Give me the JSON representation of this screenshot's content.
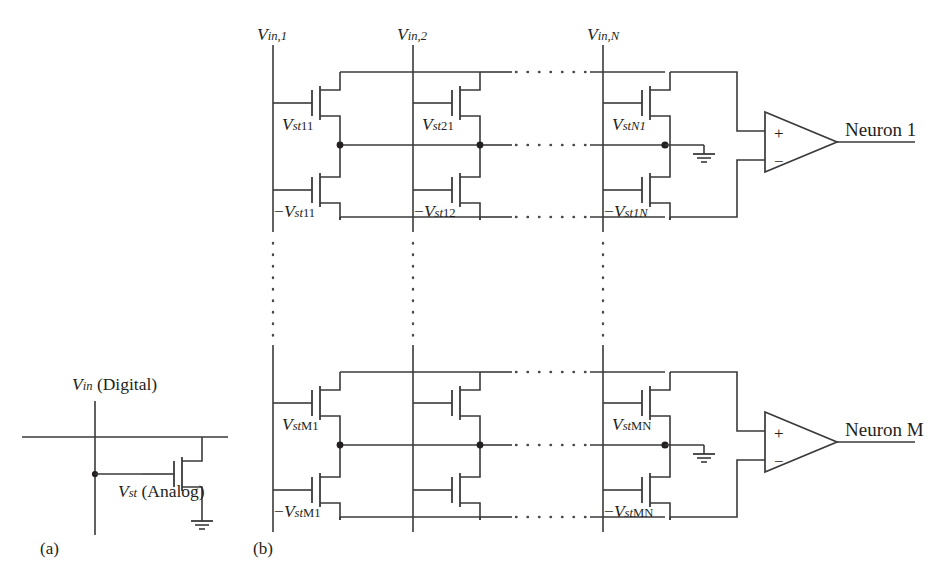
{
  "figure": {
    "panel_a_label": "(a)",
    "panel_b_label": "(b)",
    "background": "#ffffff",
    "ink": "#231f20"
  },
  "panel_a": {
    "input_label_v": "V",
    "input_label_sub": "in",
    "input_label_rest": " (Digital)",
    "storage_label_v": "V",
    "storage_label_sub": "st",
    "storage_label_rest": " (Analog)",
    "ground_icon": "ground-icon",
    "transistor_icon": "mosfet-icon"
  },
  "panel_b": {
    "columns": [
      {
        "id": "col1",
        "label_v": "V",
        "label_sub": "in,1"
      },
      {
        "id": "col2",
        "label_v": "V",
        "label_sub": "in,2"
      },
      {
        "id": "colN",
        "label_v": "V",
        "label_sub": "in,N"
      }
    ],
    "ellipsis_h_label": "horizontal-ellipsis",
    "ellipsis_v_label": "vertical-ellipsis",
    "rows": [
      {
        "id": "row1",
        "neuron_label": "Neuron 1",
        "cells": [
          {
            "col": "col1",
            "pos_v": "V",
            "pos_sub": "st",
            "pos_sub2": "11",
            "neg_sign": "−",
            "neg_v": "V",
            "neg_sub": "st",
            "neg_sub2": "11"
          },
          {
            "col": "col2",
            "pos_v": "V",
            "pos_sub": "st",
            "pos_sub2": "21",
            "neg_sign": "−",
            "neg_v": "V",
            "neg_sub": "st",
            "neg_sub2": "12"
          },
          {
            "col": "colN",
            "pos_v": "V",
            "pos_sub": "st",
            "pos_sub2": "N1",
            "neg_sign": "−",
            "neg_v": "V",
            "neg_sub": "st",
            "neg_sub2": "1N"
          }
        ]
      },
      {
        "id": "rowM",
        "neuron_label": "Neuron M",
        "cells": [
          {
            "col": "col1",
            "pos_v": "V",
            "pos_sub": "st",
            "pos_sub2": "M1",
            "neg_sign": "−",
            "neg_v": "V",
            "neg_sub": "st",
            "neg_sub2": "M1"
          },
          {
            "col": "col2",
            "pos_v": "",
            "pos_sub": "",
            "pos_sub2": "",
            "neg_sign": "",
            "neg_v": "",
            "neg_sub": "",
            "neg_sub2": ""
          },
          {
            "col": "colN",
            "pos_v": "V",
            "pos_sub": "st",
            "pos_sub2": "MN",
            "neg_sign": "−",
            "neg_v": "V",
            "neg_sub": "st",
            "neg_sub2": "MN"
          }
        ]
      }
    ],
    "opamp": {
      "plus": "+",
      "minus": "−",
      "icon": "opamp-triangle-icon"
    },
    "ground_icon": "ground-icon"
  }
}
